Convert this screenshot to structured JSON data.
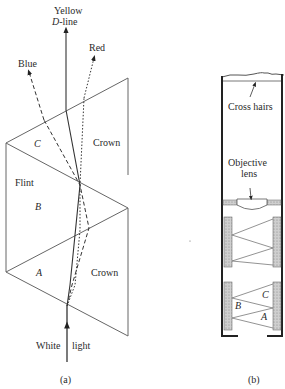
{
  "figure_a": {
    "caption": "(a)",
    "labels": {
      "yellow_line1": "Yellow",
      "yellow_line2_italic": "D",
      "yellow_line2_rest": "-line",
      "blue": "Blue",
      "red": "Red",
      "crown_top": "Crown",
      "flint": "Flint",
      "c": "C",
      "b": "B",
      "a": "A",
      "crown_bottom": "Crown",
      "white": "White",
      "light": "light"
    }
  },
  "figure_b": {
    "caption": "(b)",
    "labels": {
      "cross_hairs": "Cross hairs",
      "objective1": "Objective",
      "objective2": "lens",
      "c": "C",
      "b": "B",
      "a": "A"
    }
  },
  "colors": {
    "line": "#555555",
    "ray": "#333333",
    "hatch": "#bdbdbd"
  }
}
